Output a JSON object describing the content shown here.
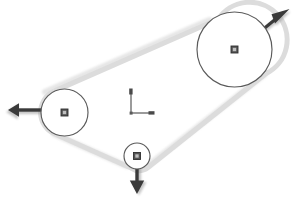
{
  "canvas": {
    "width": 299,
    "height": 200,
    "background": "#ffffff",
    "title": "Belt drive pulley system with reaction force vectors"
  },
  "colors": {
    "belt": "#dcdcdc",
    "belt_edge": "#cfcfcf",
    "pulley_outline": "#5a5a5a",
    "pulley_fill": "#ffffff",
    "hub_marker_fill": "#555555",
    "hub_marker_outline": "#2f2f2f",
    "hub_marker_inner": "#bfbfbf",
    "arrow": "#3a3a3a",
    "arrow_shadow": "#9a9a9a",
    "axis": "#6b6b6b"
  },
  "pulleys": [
    {
      "id": "pulley-large",
      "label": "Large pulley",
      "cx": 234.5,
      "cy": 49.5,
      "r": 37.5,
      "hub_size": 7
    },
    {
      "id": "pulley-medium",
      "label": "Medium pulley",
      "cx": 64.5,
      "cy": 112.5,
      "r": 23.5,
      "hub_size": 7
    },
    {
      "id": "pulley-small",
      "label": "Small idler pulley",
      "cx": 137.0,
      "cy": 156.0,
      "r": 13.0,
      "hub_size": 7
    }
  ],
  "belt": {
    "id": "belt-loop",
    "label": "Drive belt",
    "width": 5,
    "segments": [
      {
        "from": "pulley-medium",
        "to": "pulley-large",
        "side": "upper"
      },
      {
        "from": "pulley-large",
        "to": "pulley-small",
        "side": "lower-right"
      },
      {
        "from": "pulley-small",
        "to": "pulley-medium",
        "side": "lower-left"
      }
    ]
  },
  "force_vectors": [
    {
      "id": "vector-upper-right",
      "label": "Reaction force at large pulley",
      "origin_x": 261,
      "origin_y": 30,
      "tip_x": 289,
      "tip_y": 9,
      "direction": "up-right",
      "angle_deg": 37
    },
    {
      "id": "vector-left",
      "label": "Reaction force at medium pulley",
      "origin_x": 46,
      "origin_y": 110,
      "tip_x": 9,
      "tip_y": 110,
      "direction": "left",
      "angle_deg": 180
    },
    {
      "id": "vector-down",
      "label": "Reaction force at small pulley",
      "origin_x": 137,
      "origin_y": 158,
      "tip_x": 137,
      "tip_y": 194,
      "direction": "down",
      "angle_deg": 270
    }
  ],
  "axis_indicator": {
    "id": "coordinate-axes",
    "label": "Coordinate reference axes",
    "origin_x": 131,
    "origin_y": 113,
    "y_tip_x": 131,
    "y_tip_y": 90,
    "x_tip_x": 152,
    "x_tip_y": 113,
    "x_label": "",
    "y_label": ""
  }
}
